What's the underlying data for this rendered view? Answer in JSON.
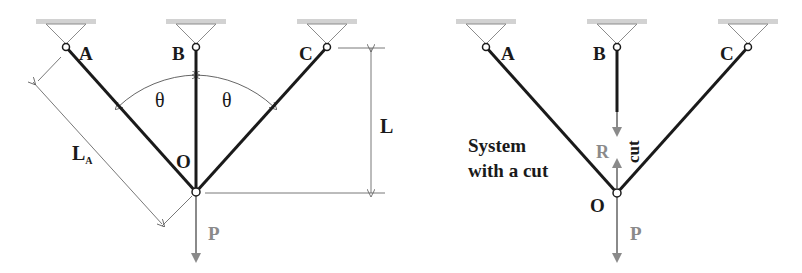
{
  "colors": {
    "bar": "#1a1a1a",
    "dimension": "#555555",
    "support_fill": "#d2d2d2",
    "support_line": "#8c8c8c",
    "force": "#8a8a8a",
    "text": "#1a1a1a",
    "force_text": "#8a8a8a"
  },
  "left_diagram": {
    "nodes": {
      "A": "A",
      "B": "B",
      "C": "C",
      "O": "O"
    },
    "angle_left": "θ",
    "angle_right": "θ",
    "dim_length": "L",
    "dim_bar_length_main": "L",
    "dim_bar_length_sub": "A",
    "load": "P"
  },
  "right_diagram": {
    "nodes": {
      "A": "A",
      "B": "B",
      "C": "C",
      "O": "O"
    },
    "caption_line1": "System",
    "caption_line2": "with a cut",
    "cut_label": "cut",
    "reaction": "R",
    "load": "P"
  }
}
